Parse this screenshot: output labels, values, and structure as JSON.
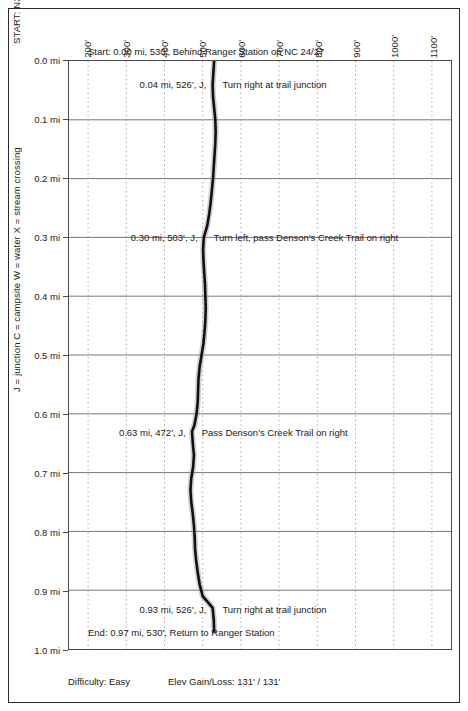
{
  "chart_data": {
    "type": "line",
    "title": "",
    "xlabel": "",
    "ylabel": "",
    "orientation": "vertical-distance",
    "grid": true,
    "xlim": [
      150,
      1150
    ],
    "ylim": [
      0.0,
      1.0
    ],
    "x_ticks": [
      "200'",
      "300'",
      "400'",
      "500'",
      "600'",
      "700'",
      "800'",
      "900'",
      "1000'",
      "1100'"
    ],
    "x_tick_values": [
      200,
      300,
      400,
      500,
      600,
      700,
      800,
      900,
      1000,
      1100
    ],
    "y_ticks": [
      "0.0 mi",
      "0.1 mi",
      "0.2 mi",
      "0.3 mi",
      "0.4 mi",
      "0.5 mi",
      "0.6 mi",
      "0.7 mi",
      "0.8 mi",
      "0.9 mi",
      "1.0 mi"
    ],
    "y_tick_values": [
      0.0,
      0.1,
      0.2,
      0.3,
      0.4,
      0.5,
      0.6,
      0.7,
      0.8,
      0.9,
      1.0
    ],
    "series_name": "Elevation profile",
    "distance_mi": [
      0.0,
      0.02,
      0.04,
      0.06,
      0.08,
      0.1,
      0.12,
      0.14,
      0.16,
      0.18,
      0.2,
      0.22,
      0.24,
      0.26,
      0.28,
      0.3,
      0.32,
      0.34,
      0.36,
      0.38,
      0.4,
      0.42,
      0.44,
      0.46,
      0.48,
      0.5,
      0.52,
      0.54,
      0.56,
      0.58,
      0.6,
      0.62,
      0.63,
      0.65,
      0.67,
      0.69,
      0.71,
      0.73,
      0.75,
      0.77,
      0.79,
      0.81,
      0.83,
      0.85,
      0.87,
      0.89,
      0.91,
      0.93,
      0.95,
      0.97
    ],
    "elevation_ft": [
      530,
      528,
      526,
      527,
      530,
      533,
      534,
      533,
      531,
      529,
      527,
      524,
      521,
      517,
      512,
      503,
      501,
      502,
      504,
      506,
      507,
      508,
      507,
      505,
      502,
      497,
      492,
      489,
      488,
      487,
      484,
      478,
      472,
      474,
      477,
      475,
      470,
      468,
      470,
      474,
      477,
      479,
      480,
      483,
      487,
      492,
      500,
      526,
      529,
      530
    ]
  },
  "axes": {
    "x_tick_labels": [
      "200'",
      "300'",
      "400'",
      "500'",
      "600'",
      "700'",
      "800'",
      "900'",
      "1000'",
      "1100'"
    ],
    "y_tick_labels": [
      "0.0 mi",
      "0.1 mi",
      "0.2 mi",
      "0.3 mi",
      "0.4 mi",
      "0.5 mi",
      "0.6 mi",
      "0.7 mi",
      "0.8 mi",
      "0.9 mi",
      "1.0 mi"
    ]
  },
  "side_captions": {
    "start_coords": "START: N35.36210 W79.86276  UTM 17 S 603318 3913793",
    "legend": "J = junction  C = campsite  W = water  X = stream crossing"
  },
  "annotations": [
    {
      "id": "start",
      "measure": "Start: 0.00 mi, 530', Behind Ranger Station on NC 24/27",
      "note": "",
      "mile": 0.0,
      "elevation": "530'",
      "code": ""
    },
    {
      "id": "waypoint-004",
      "measure": "0.04 mi, 526', J,",
      "note": "Turn right at trail junction",
      "mile": 0.04,
      "elevation": "526'",
      "code": "J"
    },
    {
      "id": "waypoint-030",
      "measure": "0.30 mi, 503', J,",
      "note": "Turn left, pass Denson's Creek Trail on right",
      "mile": 0.3,
      "elevation": "503'",
      "code": "J"
    },
    {
      "id": "waypoint-063",
      "measure": "0.63 mi, 472', J,",
      "note": "Pass Denson's Creek Trail on right",
      "mile": 0.63,
      "elevation": "472'",
      "code": "J"
    },
    {
      "id": "waypoint-093",
      "measure": "0.93 mi, 526', J,",
      "note": "Turn right at trail junction",
      "mile": 0.93,
      "elevation": "526'",
      "code": "J"
    },
    {
      "id": "end",
      "measure": "End: 0.97 mi, 530', Return to Ranger Station",
      "note": "",
      "mile": 0.97,
      "elevation": "530'",
      "code": ""
    }
  ],
  "footer": {
    "difficulty": "Difficulty: Easy",
    "elev_gain_loss": "Elev Gain/Loss: 131' / 131'"
  },
  "colors": {
    "trace": "#101010",
    "grid_major": "#777777",
    "grid_minor": "#aaaaaa",
    "frame": "#2b2b2b",
    "text": "#1a1a1a",
    "background": "#ffffff"
  }
}
